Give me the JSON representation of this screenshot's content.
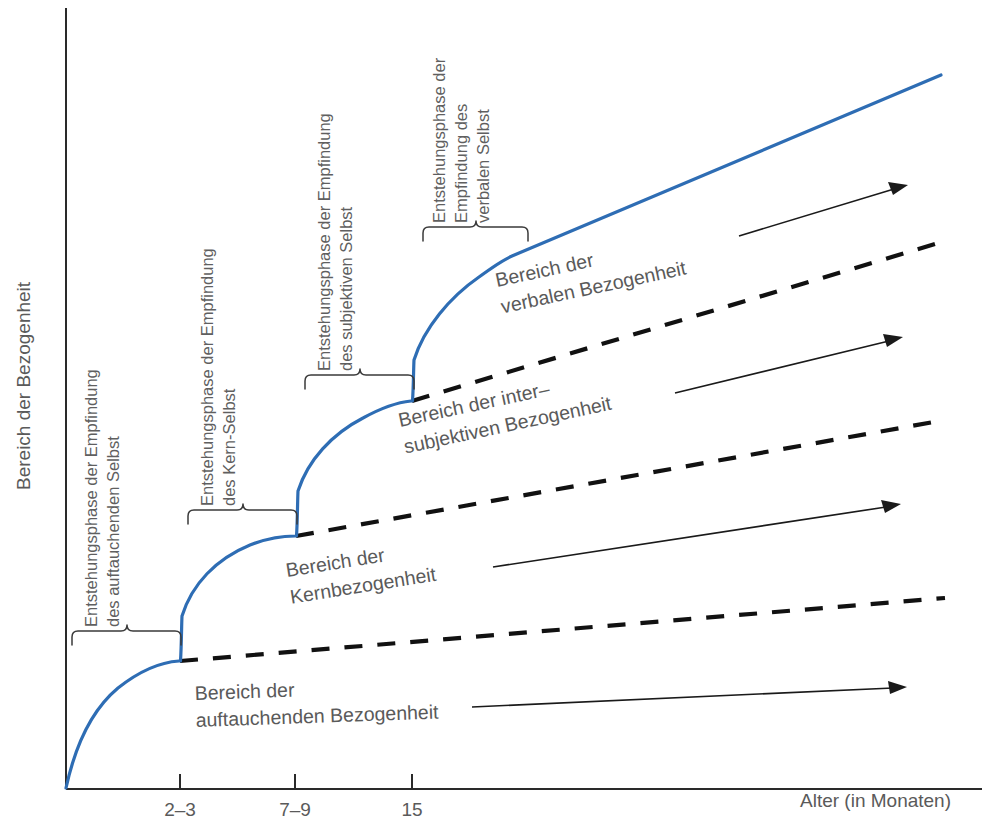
{
  "figure": {
    "type": "diagram",
    "kind": "stern-domains-of-relatedness",
    "background": "#ffffff",
    "curve_color": "#2e6db4",
    "divider_color": "#111111",
    "text_color": "#5a5a5a",
    "axis_color": "#2a2a2a"
  },
  "axes": {
    "y_label": "Bereich der Bezogenheit",
    "x_label": "Alter (in Monaten)",
    "x_ticks": [
      {
        "label": "2–3",
        "x": 180
      },
      {
        "label": "7–9",
        "x": 295
      },
      {
        "label": "15",
        "x": 412
      }
    ]
  },
  "phases": [
    {
      "id": "auftauchendes-selbst",
      "lines": [
        "Entstehungsphase der Empfindung",
        "des auftauchenden Selbst"
      ],
      "bracket": {
        "x0": 72,
        "x1": 181,
        "y": 636
      }
    },
    {
      "id": "kern-selbst",
      "lines": [
        "Entstehungsphase der Empfindung",
        "des Kern-Selbst"
      ],
      "bracket": {
        "x0": 188,
        "x1": 297,
        "y": 515
      }
    },
    {
      "id": "subjektives-selbst",
      "lines": [
        "Entstehungsphase der Empfindung",
        "des subjektiven Selbst"
      ],
      "bracket": {
        "x0": 305,
        "x1": 414,
        "y": 380
      }
    },
    {
      "id": "verbales-selbst",
      "lines": [
        "Entstehungsphase der",
        "Empfindung des",
        "verbalen Selbst"
      ],
      "bracket": {
        "x0": 423,
        "x1": 528,
        "y": 232
      }
    }
  ],
  "regions": [
    {
      "id": "auftauchende-bezogenheit",
      "lines": [
        "Bereich der",
        "auftauchenden Bezogenheit"
      ],
      "x": 195,
      "y": 700,
      "rotate": -2
    },
    {
      "id": "kernbezogenheit",
      "lines": [
        "Bereich der",
        "Kernbezogenheit"
      ],
      "x": 287,
      "y": 577,
      "rotate": -9
    },
    {
      "id": "intersubjektive-bezogenheit",
      "lines": [
        "Bereich der inter–",
        "subjektiven Bezogenheit"
      ],
      "x": 400,
      "y": 427,
      "rotate": -12
    },
    {
      "id": "verbale-bezogenheit",
      "lines": [
        "Bereich der",
        "verbalen Bezogenheit"
      ],
      "x": 497,
      "y": 287,
      "rotate": -12
    }
  ],
  "dividers": [
    {
      "id": "divider-1",
      "from": [
        180,
        661
      ],
      "to": [
        945,
        598
      ]
    },
    {
      "id": "divider-2",
      "from": [
        296,
        536
      ],
      "to": [
        945,
        420
      ]
    },
    {
      "id": "divider-3",
      "from": [
        412,
        401
      ],
      "to": [
        945,
        241
      ]
    }
  ],
  "arrows": [
    {
      "id": "arrow-auftauchende",
      "from": [
        472,
        707
      ],
      "to": [
        905,
        687
      ]
    },
    {
      "id": "arrow-kern",
      "from": [
        493,
        567
      ],
      "to": [
        898,
        505
      ]
    },
    {
      "id": "arrow-intersubjektiv",
      "from": [
        675,
        393
      ],
      "to": [
        901,
        338
      ]
    },
    {
      "id": "arrow-verbal",
      "from": [
        739,
        236
      ],
      "to": [
        906,
        185
      ]
    }
  ],
  "curve": {
    "id": "relatedness-curve",
    "description": "Stufenförmig ansteigende blaue Kurve mit vier Abschnitten",
    "path": "M 66,788 C 78,740 96,706 118,687 C 142,667 163,662 180,661 L 180,661 C 181,648 181,628 181,618 C 190,586 215,560 250,545 C 268,538 284,536 296,536 L 296,536 C 297,523 297,502 297,492 C 306,462 330,435 362,418 C 382,407 400,402 412,401 L 412,401 C 413,388 413,372 413,362 C 422,330 448,298 478,277 C 493,266 504,259 512,256 L 941,75"
  }
}
